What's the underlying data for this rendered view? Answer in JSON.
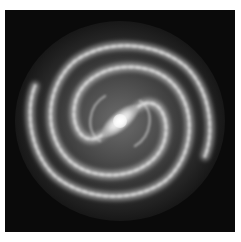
{
  "image": {
    "subject": "barred spiral galaxy",
    "color_mode": "grayscale",
    "background_color": "#0a0a0a",
    "border_color": "#ffffff",
    "core_color": "#ffffff",
    "arm_color": "#d8d8d8"
  }
}
